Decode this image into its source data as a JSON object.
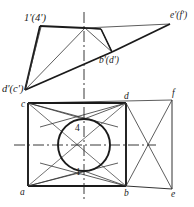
{
  "figure": {
    "type": "orthographic-projection-drawing",
    "title": "",
    "background_color": "#ffffff",
    "line_color": "#1a1a1a",
    "thin_line_color": "#333333",
    "centerline_color": "#222222"
  },
  "labels": {
    "front_view": {
      "top_left": "1'(4')",
      "top_right": "e'(f')",
      "middle_right": "b'(d')",
      "left": "d'(c')"
    },
    "top_view": {
      "c": "c",
      "d": "d",
      "f": "f",
      "a": "a",
      "b": "b",
      "e": "e",
      "point_4": "4",
      "point_1": "1"
    }
  },
  "geometry": {
    "front_view": {
      "p_1_4": [
        40,
        26
      ],
      "apex": [
        85,
        28
      ],
      "p_e_f": [
        170,
        24
      ],
      "p_b_d": [
        112,
        52
      ],
      "p_d_c": [
        25,
        90
      ],
      "inner_notch": [
        101,
        29
      ]
    },
    "top_view": {
      "c": [
        28,
        103
      ],
      "d": [
        126,
        103
      ],
      "f": [
        172,
        100
      ],
      "a": [
        28,
        186
      ],
      "b": [
        126,
        186
      ],
      "e": [
        172,
        189
      ],
      "circle_center": [
        84,
        145
      ],
      "circle_radius": 26,
      "point_4": [
        84,
        122
      ],
      "point_1": [
        84,
        172
      ]
    },
    "centerlines": {
      "vertical_x": 84,
      "vertical_from_y": 12,
      "vertical_to_y": 200,
      "horizontal_y": 145,
      "horizontal_from_x": 14,
      "horizontal_to_x": 156
    }
  }
}
